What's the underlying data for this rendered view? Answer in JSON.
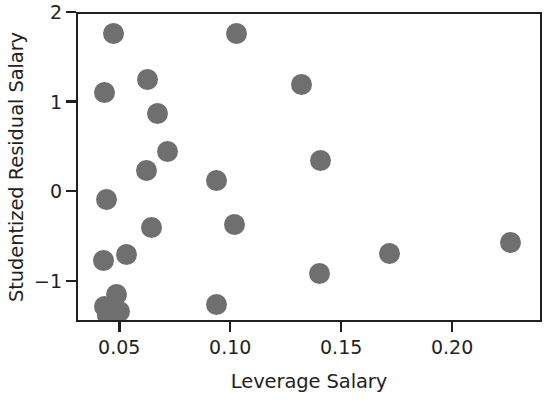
{
  "chart_data": {
    "type": "scatter",
    "title": "",
    "xlabel": "Leverage Salary",
    "ylabel": "Studentized Residual Salary",
    "xlim": [
      0.0305,
      0.2405
    ],
    "ylim": [
      -1.46,
      2.0
    ],
    "xticks": [
      0.05,
      0.1,
      0.15,
      0.2
    ],
    "xticklabels": [
      "0.05",
      "0.10",
      "0.15",
      "0.20"
    ],
    "yticks": [
      -1,
      0,
      1,
      2
    ],
    "yticklabels": [
      "−1",
      "0",
      "1",
      "2"
    ],
    "grid": false,
    "legend": null,
    "marker": {
      "shape": "circle",
      "color": "#6f6f6f",
      "size_px": 21
    },
    "frame_color": "#231f20",
    "background": "#ffffff",
    "points": [
      {
        "x": 0.0465,
        "y": 1.78
      },
      {
        "x": 0.102,
        "y": 1.78
      },
      {
        "x": 0.062,
        "y": 1.27
      },
      {
        "x": 0.131,
        "y": 1.21
      },
      {
        "x": 0.0425,
        "y": 1.12
      },
      {
        "x": 0.0665,
        "y": 0.89
      },
      {
        "x": 0.071,
        "y": 0.46
      },
      {
        "x": 0.14,
        "y": 0.37
      },
      {
        "x": 0.0615,
        "y": 0.25
      },
      {
        "x": 0.093,
        "y": 0.14
      },
      {
        "x": 0.0435,
        "y": -0.07
      },
      {
        "x": 0.0635,
        "y": -0.38
      },
      {
        "x": 0.101,
        "y": -0.35
      },
      {
        "x": 0.2255,
        "y": -0.55
      },
      {
        "x": 0.0525,
        "y": -0.68
      },
      {
        "x": 0.171,
        "y": -0.67
      },
      {
        "x": 0.042,
        "y": -0.75
      },
      {
        "x": 0.1395,
        "y": -0.9
      },
      {
        "x": 0.048,
        "y": -1.13
      },
      {
        "x": 0.093,
        "y": -1.24
      },
      {
        "x": 0.0425,
        "y": -1.27
      },
      {
        "x": 0.049,
        "y": -1.32
      },
      {
        "x": 0.044,
        "y": -1.36
      }
    ]
  }
}
